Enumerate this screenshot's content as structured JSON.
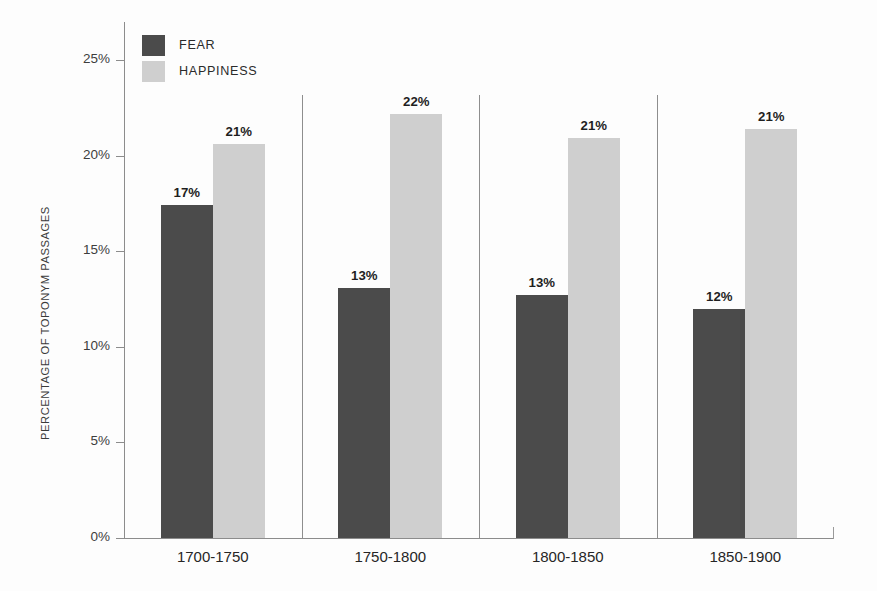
{
  "chart_data": {
    "type": "bar",
    "title": "",
    "subtitle": "",
    "xlabel": "",
    "ylabel": "PERCENTAGE OF TOPONYM PASSAGES",
    "ylim": [
      0,
      26.5
    ],
    "ytick_values": [
      0,
      5,
      10,
      15,
      20,
      25
    ],
    "ytick_labels": [
      "0%",
      "5%",
      "10%",
      "15%",
      "20%",
      "25%"
    ],
    "grid": false,
    "legend_position": "top-left",
    "categories": [
      "1700-1750",
      "1750-1800",
      "1800-1850",
      "1850-1900"
    ],
    "series": [
      {
        "name": "FEAR",
        "color": "#4b4b4b",
        "values": [
          17,
          13,
          13,
          12
        ],
        "actual_values": [
          17.4,
          13.1,
          12.7,
          12.0
        ],
        "labels": [
          "17%",
          "13%",
          "13%",
          "12%"
        ]
      },
      {
        "name": "HAPPINESS",
        "color": "#cfcfcf",
        "values": [
          21,
          22,
          21,
          21
        ],
        "actual_values": [
          20.6,
          22.2,
          20.9,
          21.4
        ],
        "labels": [
          "21%",
          "22%",
          "21%",
          "21%"
        ]
      }
    ]
  },
  "legend": {
    "items": [
      {
        "label": "FEAR",
        "swatch_class": "fear"
      },
      {
        "label": "HAPPINESS",
        "swatch_class": "happy"
      }
    ]
  },
  "axis": {
    "y_title": "PERCENTAGE OF TOPONYM PASSAGES"
  }
}
